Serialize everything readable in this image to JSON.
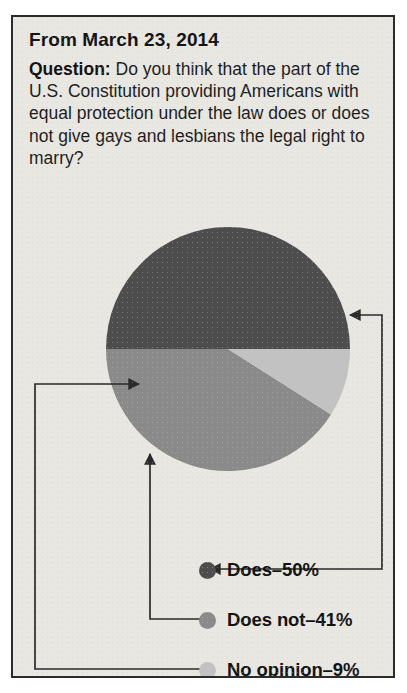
{
  "panel": {
    "date_line": "From March 23, 2014",
    "question_label": "Question:",
    "question_text": " Do you think that the part of the U.S. Constitution providing Americans with equal protection under the law does or does not give gays and lesbians the legal right to marry?",
    "border_color": "#2b2b2b",
    "background_color": "#e9e7e2"
  },
  "legend": {
    "items": [
      {
        "label": "Does–50%",
        "color": "#4d4d4d",
        "value": 50
      },
      {
        "label": "Does not–41%",
        "color": "#8a8a8a",
        "value": 41
      },
      {
        "label": "No opinion–9%",
        "color": "#c2c2c2",
        "value": 9
      }
    ]
  },
  "chart_data": {
    "type": "pie",
    "title": "From March 23, 2014",
    "question": "Do you think that the part of the U.S. Constitution providing Americans with equal protection under the law does or does not give gays and lesbians the legal right to marry?",
    "categories": [
      "Does",
      "Does not",
      "No opinion"
    ],
    "values": [
      50,
      41,
      9
    ],
    "labels": [
      "Does–50%",
      "Does not–41%",
      "No opinion–9%"
    ],
    "colors": [
      "#4d4d4d",
      "#8a8a8a",
      "#c2c2c2"
    ],
    "units": "percent",
    "legend_position": "bottom",
    "start_angle_deg": 0,
    "direction": "clockwise",
    "grid": false
  }
}
